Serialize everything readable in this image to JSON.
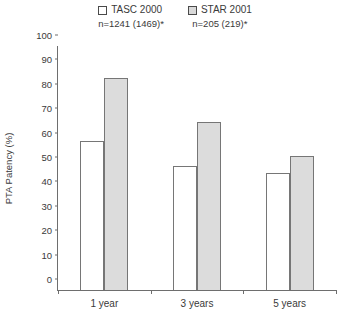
{
  "chart_data": {
    "type": "bar",
    "title": "",
    "subtitle": "",
    "xlabel": "",
    "ylabel": "PTA Patency (%)",
    "categories": [
      "1 year",
      "3 years",
      "5 years"
    ],
    "series": [
      {
        "name": "TASC 2000",
        "note": "n=1241 (1469)*",
        "color": "#ffffff",
        "values": [
          61,
          51,
          48
        ]
      },
      {
        "name": "STAR 2001",
        "note": "n=205 (219)*",
        "color": "#dcdcdc",
        "values": [
          87,
          69,
          55
        ]
      }
    ],
    "ylim": [
      0,
      100
    ],
    "ytick_step": 10,
    "yticks": [
      "0",
      "10",
      "20",
      "30",
      "40",
      "50",
      "60",
      "70",
      "80",
      "90",
      "100"
    ],
    "grid": false,
    "legend_position": "top-center"
  },
  "legend": {
    "entries": [
      {
        "label": "TASC 2000",
        "n": "n=1241 (1469)*",
        "swatch": "white-square-icon"
      },
      {
        "label": "STAR 2001",
        "n": "n=205 (219)*",
        "swatch": "gray-square-icon"
      }
    ]
  },
  "axes": {
    "y_title": "PTA Patency (%)",
    "x_categories": [
      "1 year",
      "3 years",
      "5 years"
    ]
  }
}
